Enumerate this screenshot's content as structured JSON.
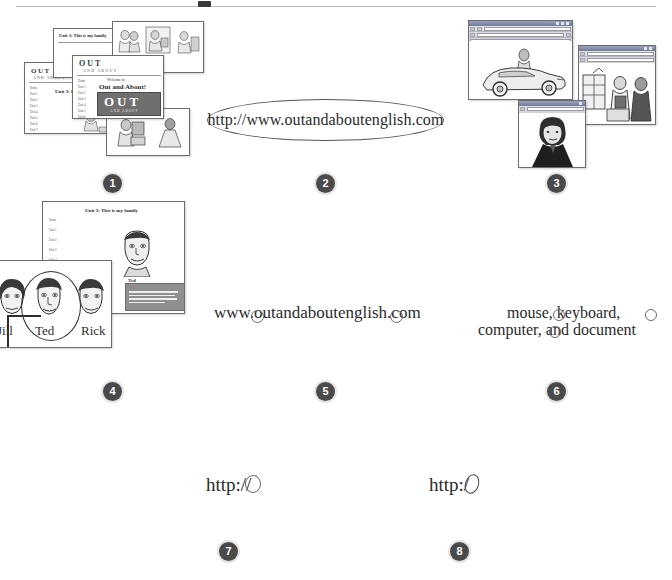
{
  "page": {
    "background": "#ffffff",
    "rule_color": "#b9b9b9",
    "badge_color": "#4a4a4a",
    "badge_text_color": "#ffffff"
  },
  "badges": [
    {
      "number": "1"
    },
    {
      "number": "2"
    },
    {
      "number": "3"
    },
    {
      "number": "4"
    },
    {
      "number": "5"
    },
    {
      "number": "6"
    },
    {
      "number": "7"
    },
    {
      "number": "8"
    }
  ],
  "items": {
    "item1": {
      "caption": "1",
      "kind": "slide-stack",
      "slides": [
        {
          "title": "Unit 3: This is my family"
        },
        {
          "title": "OUT"
        },
        {
          "title": "Unit 3: Home"
        },
        {
          "title": "Welcome to Out and About!"
        }
      ],
      "banner_text": "OUT",
      "banner_subtext": "AND ABOUT",
      "welcome_label": "Welcome to",
      "welcome_title": "Out and About!",
      "nav_items": [
        "Home",
        "Unit 1",
        "Unit 2",
        "Unit 3",
        "Unit 4",
        "Unit 5",
        "Unit 6",
        "Unit 7"
      ]
    },
    "item2": {
      "caption": "2",
      "kind": "ellipse-callout",
      "text": "http://www.outandaboutenglish.com"
    },
    "item3": {
      "caption": "3",
      "kind": "browser-window-stack",
      "windows": [
        {
          "image": "car-photo"
        },
        {
          "image": "market-scene"
        },
        {
          "image": "portrait-photo"
        }
      ]
    },
    "item4": {
      "caption": "4",
      "kind": "slide-with-characters",
      "slide_title": "Unit 3: This is my family",
      "nav_items": [
        "Home",
        "Unit 1",
        "Unit 2",
        "Unit 3",
        "Unit 4",
        "Unit 5",
        "Unit 6",
        "Unit 7"
      ],
      "character_names": [
        "Jill",
        "Ted",
        "Rick"
      ],
      "selected_character": "Ted",
      "callout_label": "Ted"
    },
    "item5": {
      "caption": "5",
      "kind": "annotated-text",
      "text": "www.outandaboutenglish.com",
      "annotations": [
        "circled-dot-1",
        "circled-dot-2"
      ]
    },
    "item6": {
      "caption": "6",
      "kind": "annotated-text",
      "line1": "mouse, keyboard,",
      "line2": "computer, and document",
      "annotations": [
        "circled-comma-1",
        "circled-comma-2",
        "circled-comma-3"
      ]
    },
    "item7": {
      "caption": "7",
      "kind": "annotated-text",
      "text": "http://",
      "annotations": [
        "circled-colon"
      ]
    },
    "item8": {
      "caption": "8",
      "kind": "annotated-text",
      "text": "http:/",
      "annotations": [
        "circled-slash"
      ]
    }
  }
}
